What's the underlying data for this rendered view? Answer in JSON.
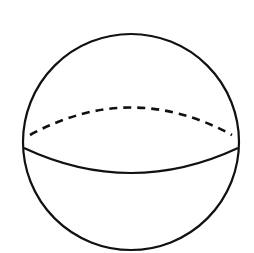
{
  "diagram": {
    "background": "#ffffff",
    "stroke_color": "#111111",
    "outline": {
      "cx": 131,
      "cy": 142,
      "r": 108,
      "stroke_width": 2.2
    },
    "equator_front": {
      "path": "M 24 148 Q 131 198 238 148",
      "stroke_width": 2.2
    },
    "equator_back": {
      "path": "M 30 135 Q 131 80 232 135",
      "stroke_width": 2.6,
      "dash": "8 6"
    }
  }
}
